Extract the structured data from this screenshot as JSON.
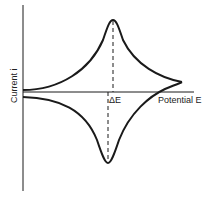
{
  "diagram": {
    "type": "cyclic-voltammogram",
    "y_axis_label": "Current i",
    "x_axis_label": "Potential E",
    "peak_separation_label": "ΔE",
    "colors": {
      "line": "#1a1a1a",
      "background": "#ffffff"
    }
  }
}
